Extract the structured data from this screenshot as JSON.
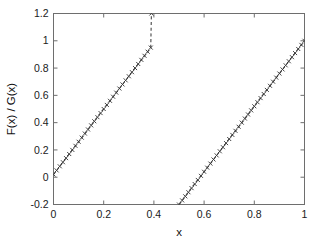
{
  "figure": {
    "background_color": "#ffffff",
    "axis_color": "#6e6e6e",
    "line_color": "#3c3c3c",
    "marker_color": "#3a3a3a"
  },
  "chart_data": {
    "type": "line",
    "title": "",
    "subtitle": "",
    "xlabel": "x",
    "ylabel": "F(x) / G(x)",
    "xlim": [
      0,
      1
    ],
    "ylim": [
      -0.2,
      1.2
    ],
    "xticks": [
      0,
      0.2,
      0.4,
      0.6,
      0.8,
      1
    ],
    "xticklabels": [
      "0",
      "0.2",
      "0.4",
      "0.6",
      "0.8",
      "1"
    ],
    "yticks": [
      -0.2,
      0,
      0.2,
      0.4,
      0.6,
      0.8,
      1,
      1.2
    ],
    "yticklabels": [
      "-0.2",
      "0",
      "0.2",
      "0.4",
      "0.6",
      "0.8",
      "1",
      "1.2"
    ],
    "grid": false,
    "legend": null,
    "legend_position": "none",
    "line_style": "dashed",
    "marker_style": "cross",
    "annotations": [],
    "series": [
      {
        "name": "branch-1",
        "x": [
          0.0,
          0.0125,
          0.025,
          0.0375,
          0.05,
          0.0625,
          0.075,
          0.0875,
          0.1,
          0.1125,
          0.125,
          0.1375,
          0.15,
          0.1625,
          0.175,
          0.1875,
          0.2,
          0.2125,
          0.225,
          0.2375,
          0.25,
          0.2625,
          0.275,
          0.2875,
          0.3,
          0.3125,
          0.325,
          0.3375,
          0.35,
          0.3625,
          0.375,
          0.3875,
          0.39
        ],
        "y": [
          0.02,
          0.05,
          0.08,
          0.11,
          0.14,
          0.17,
          0.2,
          0.23,
          0.26,
          0.29,
          0.32,
          0.35,
          0.38,
          0.41,
          0.44,
          0.47,
          0.5,
          0.53,
          0.56,
          0.59,
          0.62,
          0.65,
          0.68,
          0.71,
          0.74,
          0.77,
          0.8,
          0.83,
          0.86,
          0.89,
          0.92,
          0.95,
          1.2
        ]
      },
      {
        "name": "branch-2",
        "x": [
          0.5,
          0.5125,
          0.525,
          0.5375,
          0.55,
          0.5625,
          0.575,
          0.5875,
          0.6,
          0.6125,
          0.625,
          0.6375,
          0.65,
          0.6625,
          0.675,
          0.6875,
          0.7,
          0.7125,
          0.725,
          0.7375,
          0.75,
          0.7625,
          0.775,
          0.7875,
          0.8,
          0.8125,
          0.825,
          0.8375,
          0.85,
          0.8625,
          0.875,
          0.8875,
          0.9,
          0.9125,
          0.925,
          0.9375,
          0.95,
          0.9625,
          0.975,
          0.9875,
          1.0
        ],
        "y": [
          -0.2,
          -0.17,
          -0.14,
          -0.11,
          -0.08,
          -0.05,
          -0.02,
          0.01,
          0.04,
          0.07,
          0.1,
          0.13,
          0.16,
          0.19,
          0.22,
          0.25,
          0.28,
          0.31,
          0.34,
          0.37,
          0.4,
          0.43,
          0.46,
          0.49,
          0.52,
          0.55,
          0.58,
          0.61,
          0.64,
          0.67,
          0.7,
          0.73,
          0.76,
          0.79,
          0.82,
          0.85,
          0.88,
          0.91,
          0.94,
          0.97,
          1.0
        ]
      }
    ]
  }
}
